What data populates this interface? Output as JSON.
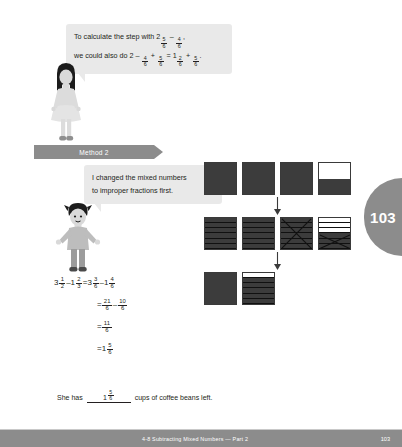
{
  "bubbles": {
    "first": {
      "line1_pre": "To calculate the step with ",
      "line1_mixed_whole": "2",
      "line1_mixed_num": "5",
      "line1_mixed_den": "6",
      "line1_minus": " – ",
      "line1_frac2_num": "4",
      "line1_frac2_den": "6",
      "line1_post": ",",
      "line2_pre": "we could also do 2 – ",
      "line2_f1_num": "4",
      "line2_f1_den": "6",
      "line2_plus": " + ",
      "line2_f2_num": "5",
      "line2_f2_den": "6",
      "line2_eq": " = ",
      "line2_mixed_whole": "1",
      "line2_mixed_num": "2",
      "line2_mixed_den": "6",
      "line2_plus2": " + ",
      "line2_f3_num": "5",
      "line2_f3_den": "6",
      "line2_end": "."
    },
    "second": {
      "line1": "I changed the mixed numbers",
      "line2": "to improper fractions first."
    }
  },
  "method_banner": {
    "label": "Method 2"
  },
  "equations": [
    {
      "id": "line-1",
      "parts": [
        {
          "type": "mixed",
          "whole": "3",
          "num": "1",
          "den": "2"
        },
        {
          "type": "text",
          "text": " – "
        },
        {
          "type": "mixed",
          "whole": "1",
          "num": "2",
          "den": "3"
        },
        {
          "type": "text",
          "text": " = "
        },
        {
          "type": "mixed",
          "whole": "3",
          "num": "3",
          "den": "6"
        },
        {
          "type": "text",
          "text": " – "
        },
        {
          "type": "mixed",
          "whole": "1",
          "num": "4",
          "den": "6"
        }
      ]
    },
    {
      "id": "line-2",
      "indent": true,
      "parts": [
        {
          "type": "text",
          "text": "= "
        },
        {
          "type": "frac",
          "num": "21",
          "den": "6"
        },
        {
          "type": "text",
          "text": " – "
        },
        {
          "type": "frac",
          "num": "10",
          "den": "6"
        }
      ]
    },
    {
      "id": "line-3",
      "indent": true,
      "parts": [
        {
          "type": "text",
          "text": "= "
        },
        {
          "type": "frac",
          "num": "11",
          "den": "6"
        }
      ]
    },
    {
      "id": "line-4",
      "indent": true,
      "parts": [
        {
          "type": "text",
          "text": "= "
        },
        {
          "type": "mixed",
          "whole": "1",
          "num": "5",
          "den": "6"
        }
      ]
    }
  ],
  "final_sentence": {
    "before": "She has",
    "answer_whole": "1",
    "answer_num": "5",
    "answer_den": "6",
    "after": "cups of coffee beans left."
  },
  "models": {
    "row1": [
      {
        "kind": "solid"
      },
      {
        "kind": "solid"
      },
      {
        "kind": "solid"
      },
      {
        "kind": "half",
        "top": "empty",
        "bottom": "fill"
      }
    ],
    "row2": [
      {
        "kind": "sixths",
        "filled": 6,
        "crossed": "none"
      },
      {
        "kind": "sixths",
        "filled": 6,
        "crossed": "none"
      },
      {
        "kind": "sixths",
        "filled": 6,
        "crossed": "full"
      },
      {
        "kind": "sixths",
        "filled": 3,
        "crossed": "lower"
      }
    ],
    "row3": [
      {
        "kind": "solid"
      },
      {
        "kind": "sixths",
        "filled": 5,
        "crossed": "none"
      }
    ]
  },
  "page_tab": {
    "number": "103"
  },
  "footer": {
    "title": "4-8 Subtracting Mixed Numbers — Part 2",
    "page": "103"
  },
  "icons": {
    "down_arrow": "down-arrow-icon",
    "girl": "girl-character-icon",
    "boy": "boy-character-icon"
  }
}
